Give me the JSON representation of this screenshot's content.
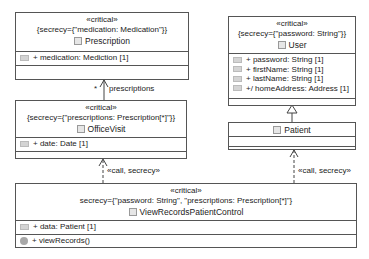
{
  "classes": {
    "prescription": {
      "stereotype": "«critical»",
      "tag": "{secrecy={\"medication: Medication\"}}",
      "name": "Prescription",
      "attributes": [
        {
          "text": "+ medication: Mediction [1]",
          "icon": "attribute-icon"
        }
      ],
      "operations": []
    },
    "user": {
      "stereotype": "«critical»",
      "tag": "{secrecy={\"password: String\"}}",
      "name": "User",
      "attributes": [
        {
          "text": "+ password: String [1]",
          "icon": "key-attribute-icon"
        },
        {
          "text": "+ firstName: String [1]",
          "icon": "key-attribute-icon"
        },
        {
          "text": "+ lastName: String [1]",
          "icon": "key-attribute-icon"
        },
        {
          "text": "+/ homeAddress: Address [1]",
          "icon": "attribute-icon"
        }
      ],
      "operations": []
    },
    "officevisit": {
      "stereotype": "«critical»",
      "tag": "{secrecy={\"prescriptions: Prescription[*]\"}}",
      "name": "OfficeVisit",
      "attributes": [
        {
          "text": "+ date: Date [1]",
          "icon": "attribute-icon"
        }
      ],
      "operations": []
    },
    "patient": {
      "name": "Patient",
      "attributes": [],
      "operations": []
    },
    "control": {
      "stereotype": "«critical»",
      "tag": "secrecy={\"password: String\", \"prescriptions: Prescription[*]\"}",
      "name": "ViewRecordsPatientControl",
      "attributes": [
        {
          "text": "+ data: Patient [1]",
          "icon": "attribute-icon"
        }
      ],
      "operations": [
        {
          "text": "+ viewRecords()",
          "icon": "operation-icon"
        }
      ]
    }
  },
  "edges": {
    "association": {
      "multiplicity": "*",
      "role": "prescriptions"
    },
    "dep_left": {
      "label": "«call, secrecy»"
    },
    "dep_right": {
      "label": "«call, secrecy»"
    },
    "generalization": {
      "from": "Patient",
      "to": "User"
    }
  }
}
